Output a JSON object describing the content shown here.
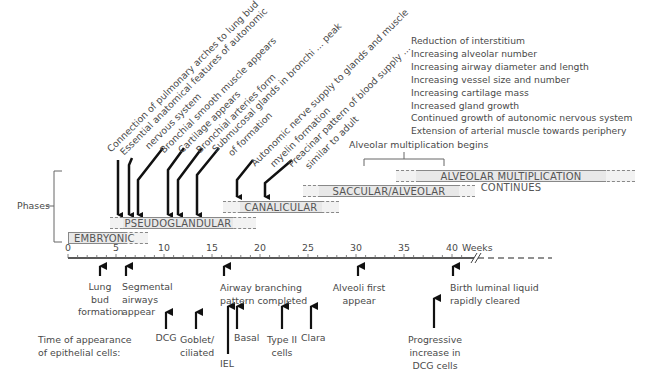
{
  "phases_label": "Phases",
  "axis": {
    "unit_label": "Weeks",
    "ticks": [
      "0",
      "5",
      "10",
      "15",
      "20",
      "25",
      "30",
      "35",
      "40"
    ]
  },
  "phases": [
    {
      "name": "EMBRYONIC",
      "start": 0,
      "end": 8
    },
    {
      "name": "PSEUDOGLANDULAR",
      "start": 5,
      "end": 17
    },
    {
      "name": "CANALICULAR",
      "start": 16,
      "end": 26
    },
    {
      "name": "SACCULAR/ALVEOLAR",
      "start": 24,
      "end": 38
    },
    {
      "name": "ALVEOLAR MULTIPLICATION CONTINUES",
      "start": 36,
      "end": 60
    }
  ],
  "alveolar_bracket_label": "Alveolar multiplication begins",
  "postnatal_list": [
    "Reduction of interstitium",
    "Increasing alveolar number",
    "Increasing airway diameter and length",
    "Increasing vessel size and number",
    "Increasing cartilage mass",
    "Increased gland growth",
    "Continued growth of autonomic nervous system",
    "Extension of arterial muscle towards periphery"
  ],
  "events_top": [
    {
      "week": 5,
      "label": "Connection of pulmonary arches to lung bud"
    },
    {
      "week": 6,
      "label": "Essential anatomical features of autonomic",
      "label2": "nervous system"
    },
    {
      "week": 7,
      "label": "Bronchial smooth muscle appears"
    },
    {
      "week": 10,
      "label": "Cartilage appears"
    },
    {
      "week": 11,
      "label": "Bronchial arteries form"
    },
    {
      "week": 13,
      "label": "Submucosal glands in bronchi ... peak",
      "label2": "of formation"
    },
    {
      "week": 17,
      "label": "Autonomic nerve supply to glands and muscle",
      "label2": "myelin formation"
    },
    {
      "week": 20,
      "label": "Preacinar pattern of blood supply ...",
      "label2": "similar to adult"
    }
  ],
  "events_bottom": [
    {
      "week": 4,
      "label": "Lung bud formation",
      "lines": [
        "Lung",
        "bud",
        "formation"
      ]
    },
    {
      "week": 6,
      "label": "Segmental airways appear",
      "lines": [
        "Segmental",
        "airways",
        "appear"
      ]
    },
    {
      "week": 16,
      "label": "Airway branching pattern completed",
      "lines": [
        "Airway branching",
        "pattern completed"
      ]
    },
    {
      "week": 30,
      "label": "Alveoli first appear",
      "lines": [
        "Alveoli first",
        "appear"
      ]
    },
    {
      "week": 40,
      "label": "Birth luminal liquid rapidly cleared",
      "lines": [
        "Birth luminal liquid",
        "rapidly cleared"
      ]
    }
  ],
  "epithelial_label": [
    "Time of appearance",
    "of epithelial cells:"
  ],
  "epithelial_cells": [
    {
      "week": 10,
      "lines": [
        "DCG"
      ]
    },
    {
      "week": 13,
      "lines": [
        "Goblet/",
        "ciliated"
      ]
    },
    {
      "week": 16,
      "lines": [
        "IEL"
      ]
    },
    {
      "week": 17,
      "lines": [
        "Basal"
      ]
    },
    {
      "week": 22,
      "lines": [
        "Type II",
        "cells"
      ]
    },
    {
      "week": 25,
      "lines": [
        "Clara"
      ]
    },
    {
      "week": 38,
      "lines": [
        "Progressive",
        "increase in",
        "DCG cells"
      ]
    }
  ]
}
